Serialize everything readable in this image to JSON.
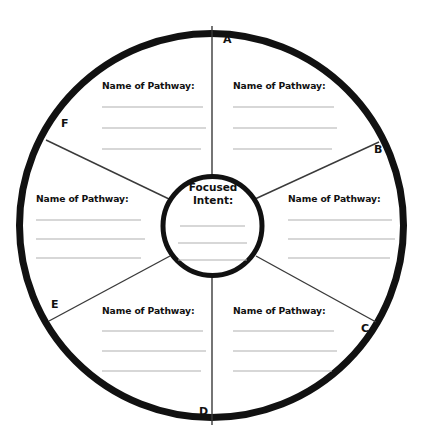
{
  "worksheet": {
    "center": {
      "title_line_1": "Focused",
      "title_line_2": "Intent:",
      "write_lines": 3
    },
    "segments": [
      {
        "letter": "A",
        "label": "Name of Pathway:",
        "write_lines": 3
      },
      {
        "letter": "B",
        "label": "Name of Pathway:",
        "write_lines": 3
      },
      {
        "letter": "C",
        "label": "Name of Pathway:",
        "write_lines": 3
      },
      {
        "letter": "D",
        "label": "Name of Pathway:",
        "write_lines": 3
      },
      {
        "letter": "E",
        "label": "Name of Pathway:",
        "write_lines": 3
      },
      {
        "letter": "F",
        "label": "Name of Pathway:",
        "write_lines": 3
      }
    ],
    "colors": {
      "background": "#ffffff",
      "outline": "#111111",
      "divider": "#3a3a3a",
      "write_line": "#b0b0b0",
      "text": "#111111"
    }
  }
}
